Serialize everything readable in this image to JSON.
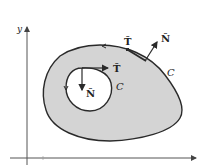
{
  "figure": {
    "axes": {
      "y_label": "y",
      "x_label": ""
    },
    "outer_curve": {
      "label": "C",
      "tangent_label": "T̂",
      "normal_label": "N̂"
    },
    "inner_curve": {
      "label": "C",
      "tangent_label": "T̂",
      "normal_label": "N̂"
    },
    "colors": {
      "region_fill": "#d4d4d4",
      "stroke": "#2a2a2a",
      "axis": "#555555",
      "background": "#ffffff"
    }
  }
}
